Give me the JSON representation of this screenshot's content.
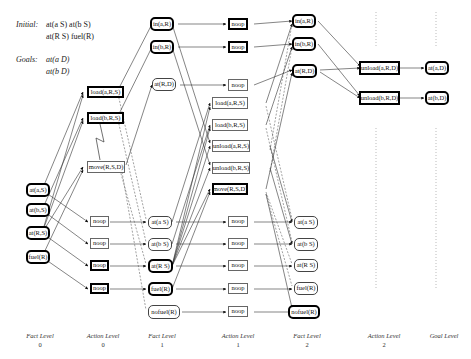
{
  "header": {
    "initial_label": "Initial:",
    "initial_line1": "at(a S)  at(b S)",
    "initial_line2": "at(R S)  fuel(R)",
    "goals_label": "Goals:",
    "goals_line1": "at(a D)",
    "goals_line2": "at(b D)"
  },
  "levels": [
    {
      "title": "Fact Level",
      "number": "0"
    },
    {
      "title": "Action Level",
      "number": "0"
    },
    {
      "title": "Fact Level",
      "number": "1"
    },
    {
      "title": "Action Level",
      "number": "1"
    },
    {
      "title": "Fact Level",
      "number": "2"
    },
    {
      "title": "Action Level",
      "number": "2"
    },
    {
      "title": "Goal Level",
      "number": ""
    }
  ],
  "nodes": {
    "f0": [
      {
        "id": "f0_atas",
        "label": "at(a,S)",
        "bold": true
      },
      {
        "id": "f0_atbs",
        "label": "at(b,S)",
        "bold": true
      },
      {
        "id": "f0_atrs",
        "label": "at(R,S)",
        "bold": true
      },
      {
        "id": "f0_fuel",
        "label": "fuel(R)",
        "bold": true
      }
    ],
    "a0": [
      {
        "id": "a0_loada",
        "label": "load(a,R,S)",
        "bold": true
      },
      {
        "id": "a0_loadb",
        "label": "load(b,R,S)",
        "bold": true
      },
      {
        "id": "a0_move",
        "label": "move(R,S,D)",
        "bold": false
      },
      {
        "id": "a0_noop1",
        "label": "noop",
        "bold": false
      },
      {
        "id": "a0_noop2",
        "label": "noop",
        "bold": false
      },
      {
        "id": "a0_noop3",
        "label": "noop",
        "bold": true
      },
      {
        "id": "a0_noop4",
        "label": "noop",
        "bold": true
      }
    ],
    "f1": [
      {
        "id": "f1_inar",
        "label": "in(a,R)",
        "bold": true
      },
      {
        "id": "f1_inbr",
        "label": "in(b,R)",
        "bold": true
      },
      {
        "id": "f1_atrd",
        "label": "at(R,D)",
        "bold": false
      },
      {
        "id": "f1_atas",
        "label": "at(a S)",
        "bold": false
      },
      {
        "id": "f1_atbs",
        "label": "at(b S)",
        "bold": false
      },
      {
        "id": "f1_atrs",
        "label": "at(R S)",
        "bold": true
      },
      {
        "id": "f1_fuel",
        "label": "fuel(R)",
        "bold": true
      },
      {
        "id": "f1_nofuel",
        "label": "nofuel(R)",
        "bold": false
      }
    ],
    "a1": [
      {
        "id": "a1_noop1",
        "label": "noop",
        "bold": true
      },
      {
        "id": "a1_noop2",
        "label": "noop",
        "bold": true
      },
      {
        "id": "a1_noop3",
        "label": "noop",
        "bold": false
      },
      {
        "id": "a1_loada",
        "label": "load(a,R,S)",
        "bold": false
      },
      {
        "id": "a1_loadb",
        "label": "load(b,R,S)",
        "bold": false
      },
      {
        "id": "a1_unloada",
        "label": "unload(a,R,S)",
        "bold": false
      },
      {
        "id": "a1_unloadb",
        "label": "unload(b,R,S)",
        "bold": false
      },
      {
        "id": "a1_move",
        "label": "move(R,S,D)",
        "bold": true
      },
      {
        "id": "a1_noop4",
        "label": "noop",
        "bold": false
      },
      {
        "id": "a1_noop5",
        "label": "noop",
        "bold": false
      },
      {
        "id": "a1_noop6",
        "label": "noop",
        "bold": false
      },
      {
        "id": "a1_noop7",
        "label": "noop",
        "bold": false
      },
      {
        "id": "a1_noop8",
        "label": "noop",
        "bold": false
      }
    ],
    "f2": [
      {
        "id": "f2_inar",
        "label": "in(a,R)",
        "bold": true
      },
      {
        "id": "f2_inbr",
        "label": "in(b,R)",
        "bold": true
      },
      {
        "id": "f2_atrd",
        "label": "at(R,D)",
        "bold": true
      },
      {
        "id": "f2_atas",
        "label": "at(a S)",
        "bold": false
      },
      {
        "id": "f2_atbs",
        "label": "at(b S)",
        "bold": false
      },
      {
        "id": "f2_atrs",
        "label": "at(R S)",
        "bold": false
      },
      {
        "id": "f2_fuel",
        "label": "fuel(R)",
        "bold": false
      },
      {
        "id": "f2_nofuel",
        "label": "nofuel(R)",
        "bold": true
      }
    ],
    "a2": [
      {
        "id": "a2_unloada",
        "label": "unload(a,R,D)",
        "bold": true
      },
      {
        "id": "a2_unloadb",
        "label": "unload(b,R,D)",
        "bold": true
      }
    ],
    "g": [
      {
        "id": "g_atad",
        "label": "at(a,D)",
        "bold": true
      },
      {
        "id": "g_atbd",
        "label": "at(b,D)",
        "bold": true
      }
    ]
  },
  "colors": {
    "edge": "#222222",
    "node_border": "#444444",
    "bold_border": "#000000",
    "background": "#ffffff"
  }
}
